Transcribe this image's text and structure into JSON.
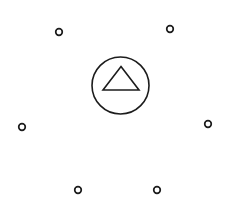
{
  "canvas": {
    "width": 240,
    "height": 210,
    "background_color": "#ffffff",
    "stroke_color": "#1c1c1c"
  },
  "diagram": {
    "name": "circled-triangle-with-surrounding-rings",
    "hub": {
      "icon_name": "circled-triangle-icon",
      "circle": {
        "cx": 120.5,
        "cy": 85.5,
        "r": 28.5,
        "stroke_width": 1.6,
        "stroke_color": "#1c1c1c",
        "fill": "none"
      },
      "triangle": {
        "icon_name": "triangle-up-icon",
        "points": "121,66.5 139,90 103,90",
        "apex_x": 121,
        "apex_y": 66.5,
        "base_left_x": 103,
        "base_right_x": 139,
        "base_y": 90,
        "stroke_width": 1.6,
        "stroke_color": "#1c1c1c",
        "fill": "none"
      }
    },
    "nodes": [
      {
        "id": "node-top-left",
        "cx": 59,
        "cy": 32,
        "r": 3.3,
        "stroke_width": 1.7,
        "stroke_color": "#1c1c1c"
      },
      {
        "id": "node-top-right",
        "cx": 170,
        "cy": 29,
        "r": 3.3,
        "stroke_width": 1.7,
        "stroke_color": "#1c1c1c"
      },
      {
        "id": "node-left",
        "cx": 22,
        "cy": 127,
        "r": 3.3,
        "stroke_width": 1.7,
        "stroke_color": "#1c1c1c"
      },
      {
        "id": "node-right",
        "cx": 208,
        "cy": 124,
        "r": 3.3,
        "stroke_width": 1.7,
        "stroke_color": "#1c1c1c"
      },
      {
        "id": "node-bottom-left",
        "cx": 78,
        "cy": 190,
        "r": 3.3,
        "stroke_width": 1.7,
        "stroke_color": "#1c1c1c"
      },
      {
        "id": "node-bottom-right",
        "cx": 157,
        "cy": 190,
        "r": 3.3,
        "stroke_width": 1.7,
        "stroke_color": "#1c1c1c"
      }
    ]
  }
}
